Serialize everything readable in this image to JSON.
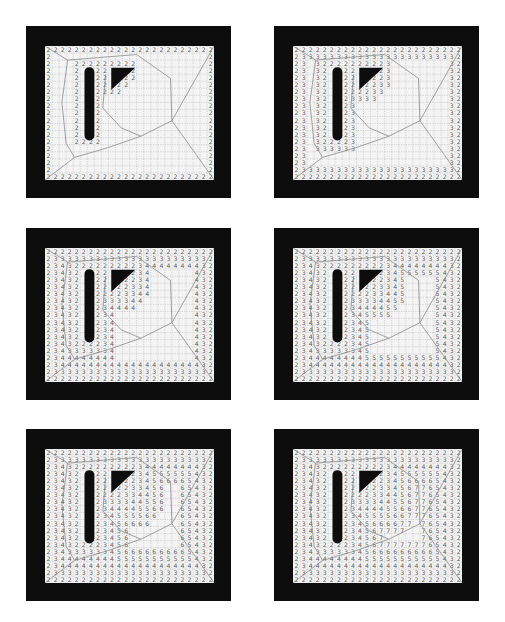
{
  "figure": {
    "grid": {
      "cols": 24,
      "rows": 19,
      "cell_px": 7.05
    },
    "colors": {
      "frame": "#0d0d0d",
      "field": "#f4f4f4",
      "grid_line": "#b0b0b0",
      "numbers": "#5a5a5a",
      "skeleton": "#8a8a8a",
      "obstacle": "#0d0d0d"
    },
    "obstacles": [
      {
        "type": "bar",
        "name": "vertical-bar",
        "x": 5.6,
        "y": 3.0,
        "w": 1.4,
        "h": 10.4
      },
      {
        "type": "triangle",
        "name": "triangle",
        "points": [
          [
            9.4,
            3.1
          ],
          [
            12.8,
            3.1
          ],
          [
            9.4,
            6.2
          ]
        ]
      }
    ],
    "panels": [
      {
        "id": "panel-1",
        "left": 26,
        "top": 26,
        "max_value": 2
      },
      {
        "id": "panel-2",
        "left": 274,
        "top": 26,
        "max_value": 3
      },
      {
        "id": "panel-3",
        "left": 26,
        "top": 228,
        "max_value": 4
      },
      {
        "id": "panel-4",
        "left": 274,
        "top": 228,
        "max_value": 5
      },
      {
        "id": "panel-5",
        "left": 26,
        "top": 429,
        "max_value": 6
      },
      {
        "id": "panel-6",
        "left": 274,
        "top": 429,
        "max_value": 7
      }
    ],
    "skeleton_paths": [
      "M0,0 L3.2,2.0 L13.0,1.2 L17.8,4.6 L18.0,10.6 L24,0",
      "M18.0,10.6 L24,19",
      "M18.0,10.6 L13.6,12.8 L9.0,14.4 L4.2,15.8 L0,19",
      "M3.2,2.0 L2.4,8 L3.0,13.8 L4.2,15.8",
      "M8.6,4.0 L8.2,8.8 L10.8,11.6 L13.6,12.8"
    ]
  }
}
